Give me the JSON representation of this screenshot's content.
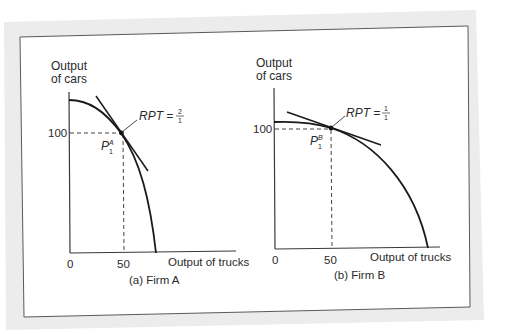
{
  "figure": {
    "colors": {
      "outer_band": "#ebebeb",
      "panel": "#ffffff",
      "frame": "#555555",
      "ink": "#1a1a1a"
    },
    "panels": [
      {
        "id": "firm-a",
        "caption": "(a) Firm A",
        "y_axis_label_line1": "Output",
        "y_axis_label_line2": "of cars",
        "x_axis_label": "Output of trucks",
        "origin_label": "0",
        "x_tick_label": "50",
        "y_tick_label": "100",
        "point_label_base": "P",
        "point_label_sub": "1",
        "point_label_sup": "A",
        "rpt_label": "RPT =",
        "rpt_numerator": "2",
        "rpt_denominator": "1"
      },
      {
        "id": "firm-b",
        "caption": "(b) Firm B",
        "y_axis_label_line1": "Output",
        "y_axis_label_line2": "of cars",
        "x_axis_label": "Output of trucks",
        "origin_label": "0",
        "x_tick_label": "50",
        "y_tick_label": "100",
        "point_label_base": "P",
        "point_label_sub": "1",
        "point_label_sup": "B",
        "rpt_label": "RPT =",
        "rpt_numerator": "1",
        "rpt_denominator": "1"
      }
    ]
  }
}
